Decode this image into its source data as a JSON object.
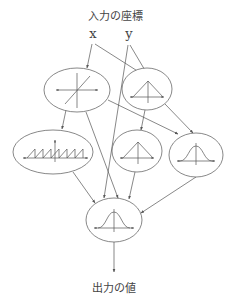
{
  "diagram": {
    "input_title": "入力の座標",
    "output_title": "出力の値",
    "inputs": [
      {
        "id": "x",
        "label": "x"
      },
      {
        "id": "y",
        "label": "y"
      }
    ],
    "nodes": [
      {
        "id": "A",
        "shape": "cross-axes",
        "description": "crossing axes with diagonal line"
      },
      {
        "id": "B",
        "shape": "triangle",
        "description": "triangular (tent) function"
      },
      {
        "id": "C",
        "shape": "sawtooth",
        "description": "sawtooth wave"
      },
      {
        "id": "D",
        "shape": "triangle",
        "description": "triangular (tent) function"
      },
      {
        "id": "E",
        "shape": "gaussian",
        "description": "gaussian bell curve"
      },
      {
        "id": "F",
        "shape": "gaussian",
        "description": "gaussian bell curve (output node)"
      }
    ],
    "edges": [
      {
        "from": "x",
        "to": "A"
      },
      {
        "from": "x",
        "to": "B"
      },
      {
        "from": "y",
        "to": "B"
      },
      {
        "from": "y",
        "to": "F"
      },
      {
        "from": "A",
        "to": "C"
      },
      {
        "from": "A",
        "to": "E"
      },
      {
        "from": "A",
        "to": "F"
      },
      {
        "from": "B",
        "to": "D"
      },
      {
        "from": "B",
        "to": "E"
      },
      {
        "from": "C",
        "to": "F"
      },
      {
        "from": "D",
        "to": "F"
      },
      {
        "from": "E",
        "to": "F"
      },
      {
        "from": "F",
        "to": "output"
      }
    ],
    "colors": {
      "stroke": "#555555",
      "text": "#444444",
      "background": "#ffffff"
    }
  }
}
